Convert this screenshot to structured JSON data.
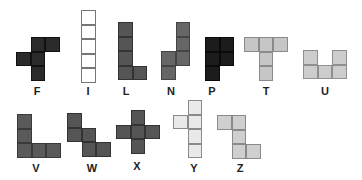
{
  "cell_size": 14.6,
  "pieces": [
    {
      "name": "F",
      "fill": "#2a2a2a",
      "stroke": "#111111",
      "origin": [
        16,
        37
      ],
      "cells": [
        [
          1,
          0
        ],
        [
          2,
          0
        ],
        [
          0,
          1
        ],
        [
          1,
          1
        ],
        [
          1,
          2
        ]
      ],
      "label_pos": [
        37,
        86
      ]
    },
    {
      "name": "I",
      "fill": "#ffffff",
      "stroke": "#777777",
      "origin": [
        81,
        10
      ],
      "cells": [
        [
          0,
          0
        ],
        [
          0,
          1
        ],
        [
          0,
          2
        ],
        [
          0,
          3
        ],
        [
          0,
          4
        ]
      ],
      "label_pos": [
        88,
        86
      ]
    },
    {
      "name": "L",
      "fill": "#555555",
      "stroke": "#333333",
      "origin": [
        118,
        22
      ],
      "cells": [
        [
          0,
          0
        ],
        [
          0,
          1
        ],
        [
          0,
          2
        ],
        [
          0,
          3
        ],
        [
          1,
          3
        ]
      ],
      "label_pos": [
        126,
        86
      ]
    },
    {
      "name": "N",
      "fill": "#666666",
      "stroke": "#444444",
      "origin": [
        161,
        22
      ],
      "cells": [
        [
          1,
          0
        ],
        [
          1,
          1
        ],
        [
          0,
          2
        ],
        [
          1,
          2
        ],
        [
          0,
          3
        ]
      ],
      "label_pos": [
        171,
        86
      ]
    },
    {
      "name": "P",
      "fill": "#1c1c1c",
      "stroke": "#0a0a0a",
      "origin": [
        205,
        37
      ],
      "cells": [
        [
          0,
          0
        ],
        [
          1,
          0
        ],
        [
          0,
          1
        ],
        [
          1,
          1
        ],
        [
          0,
          2
        ]
      ],
      "label_pos": [
        212,
        86
      ]
    },
    {
      "name": "T",
      "fill": "#c6c6c6",
      "stroke": "#8a8a8a",
      "origin": [
        244,
        37
      ],
      "cells": [
        [
          0,
          0
        ],
        [
          1,
          0
        ],
        [
          2,
          0
        ],
        [
          1,
          1
        ],
        [
          1,
          2
        ]
      ],
      "label_pos": [
        266,
        86
      ]
    },
    {
      "name": "U",
      "fill": "#cdcdcd",
      "stroke": "#8f8f8f",
      "origin": [
        303,
        50
      ],
      "cells": [
        [
          0,
          0
        ],
        [
          2,
          0
        ],
        [
          0,
          1
        ],
        [
          1,
          1
        ],
        [
          2,
          1
        ]
      ],
      "label_pos": [
        325,
        86
      ]
    },
    {
      "name": "V",
      "fill": "#5a5a5a",
      "stroke": "#3a3a3a",
      "origin": [
        17,
        114
      ],
      "cells": [
        [
          0,
          0
        ],
        [
          0,
          1
        ],
        [
          0,
          2
        ],
        [
          1,
          2
        ],
        [
          2,
          2
        ]
      ],
      "label_pos": [
        36,
        163
      ]
    },
    {
      "name": "W",
      "fill": "#555555",
      "stroke": "#333333",
      "origin": [
        67,
        113
      ],
      "cells": [
        [
          0,
          0
        ],
        [
          0,
          1
        ],
        [
          1,
          1
        ],
        [
          1,
          2
        ],
        [
          2,
          2
        ]
      ],
      "label_pos": [
        92,
        163
      ]
    },
    {
      "name": "X",
      "fill": "#555555",
      "stroke": "#333333",
      "origin": [
        116,
        110
      ],
      "cells": [
        [
          1,
          0
        ],
        [
          0,
          1
        ],
        [
          1,
          1
        ],
        [
          2,
          1
        ],
        [
          1,
          2
        ]
      ],
      "label_pos": [
        137,
        161
      ]
    },
    {
      "name": "Y",
      "fill": "#e9e9e9",
      "stroke": "#8a8a8a",
      "origin": [
        173,
        100
      ],
      "cells": [
        [
          1,
          0
        ],
        [
          0,
          1
        ],
        [
          1,
          1
        ],
        [
          1,
          2
        ],
        [
          1,
          3
        ]
      ],
      "label_pos": [
        194,
        163
      ]
    },
    {
      "name": "Z",
      "fill": "#cfcfcf",
      "stroke": "#8a8a8a",
      "origin": [
        217,
        115
      ],
      "cells": [
        [
          0,
          0
        ],
        [
          1,
          0
        ],
        [
          1,
          1
        ],
        [
          1,
          2
        ],
        [
          2,
          2
        ]
      ],
      "label_pos": [
        240,
        163
      ]
    }
  ]
}
